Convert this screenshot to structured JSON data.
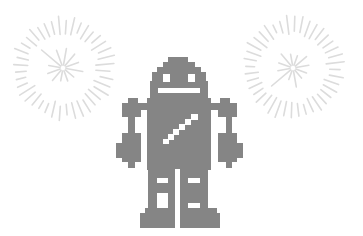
{
  "scene": {
    "title": "Pixel robot with fireworks",
    "width": 363,
    "height": 236,
    "background": "#ffffff"
  },
  "colors": {
    "robot": "#858585",
    "robot_detail": "#ffffff",
    "firework": "#dcdcdc"
  },
  "fireworks": [
    {
      "name": "firework-left",
      "cx": 63,
      "cy": 68,
      "outer": {
        "count": 40,
        "r1": 36,
        "r2": 50,
        "jitter": 3,
        "offset": 4
      },
      "inner": {
        "count": 12,
        "r1": 3,
        "r2": 20,
        "long_index": 7,
        "long_r2": 28,
        "offset": 10
      }
    },
    {
      "name": "firework-right",
      "cx": 293,
      "cy": 68,
      "outer": {
        "count": 40,
        "r1": 36,
        "r2": 50,
        "jitter": 3,
        "offset": 2
      },
      "inner": {
        "count": 12,
        "r1": 3,
        "r2": 20,
        "long_index": 4,
        "long_r2": 28,
        "offset": 20
      }
    }
  ],
  "robot": {
    "body_parts": [
      {
        "part": "head-top",
        "x": 168,
        "y": 57,
        "w": 20,
        "h": 5
      },
      {
        "part": "head-row2",
        "x": 163,
        "y": 62,
        "w": 32,
        "h": 6
      },
      {
        "part": "head-row3",
        "x": 157,
        "y": 67,
        "w": 44,
        "h": 6
      },
      {
        "part": "head-main",
        "x": 152,
        "y": 72,
        "w": 54,
        "h": 10
      },
      {
        "part": "head-lower",
        "x": 150,
        "y": 81,
        "w": 58,
        "h": 18
      },
      {
        "part": "torso",
        "x": 147,
        "y": 98,
        "w": 64,
        "h": 72
      },
      {
        "part": "left-leg",
        "x": 148,
        "y": 169,
        "w": 27,
        "h": 40
      },
      {
        "part": "right-leg",
        "x": 180,
        "y": 169,
        "w": 28,
        "h": 40
      },
      {
        "part": "left-foot-step",
        "x": 145,
        "y": 208,
        "w": 30,
        "h": 6
      },
      {
        "part": "left-foot",
        "x": 140,
        "y": 213,
        "w": 35,
        "h": 15
      },
      {
        "part": "right-foot-step",
        "x": 180,
        "y": 208,
        "w": 37,
        "h": 6
      },
      {
        "part": "right-foot",
        "x": 180,
        "y": 213,
        "w": 40,
        "h": 15
      },
      {
        "part": "left-shoulder",
        "x": 140,
        "y": 103,
        "w": 8,
        "h": 7
      },
      {
        "part": "left-arm-cap",
        "x": 128,
        "y": 98,
        "w": 10,
        "h": 6
      },
      {
        "part": "left-arm-top",
        "x": 122,
        "y": 103,
        "w": 19,
        "h": 14
      },
      {
        "part": "left-arm-shaft",
        "x": 128,
        "y": 116,
        "w": 7,
        "h": 18
      },
      {
        "part": "left-hand",
        "x": 122,
        "y": 133,
        "w": 19,
        "h": 29
      },
      {
        "part": "left-hand-bulge",
        "x": 116,
        "y": 143,
        "w": 7,
        "h": 15
      },
      {
        "part": "left-finger",
        "x": 128,
        "y": 161,
        "w": 7,
        "h": 7
      },
      {
        "part": "right-shoulder",
        "x": 210,
        "y": 103,
        "w": 9,
        "h": 7
      },
      {
        "part": "right-arm-cap",
        "x": 220,
        "y": 98,
        "w": 10,
        "h": 6
      },
      {
        "part": "right-arm-top",
        "x": 218,
        "y": 103,
        "w": 19,
        "h": 14
      },
      {
        "part": "right-arm-shaft",
        "x": 226,
        "y": 116,
        "w": 6,
        "h": 18
      },
      {
        "part": "right-hand",
        "x": 218,
        "y": 133,
        "w": 19,
        "h": 29
      },
      {
        "part": "right-hand-bulge",
        "x": 236,
        "y": 143,
        "w": 7,
        "h": 15
      },
      {
        "part": "right-finger",
        "x": 226,
        "y": 161,
        "w": 6,
        "h": 7
      }
    ],
    "details": [
      {
        "part": "left-eye",
        "x": 163,
        "y": 74,
        "w": 7,
        "h": 8
      },
      {
        "part": "right-eye",
        "x": 188,
        "y": 74,
        "w": 7,
        "h": 8
      },
      {
        "part": "mouth",
        "x": 158,
        "y": 88,
        "w": 42,
        "h": 5
      },
      {
        "part": "leg-gap",
        "x": 175,
        "y": 169,
        "w": 5,
        "h": 59
      },
      {
        "part": "left-leg-band",
        "x": 157,
        "y": 178,
        "w": 11,
        "h": 5
      },
      {
        "part": "left-leg-window",
        "x": 157,
        "y": 193,
        "w": 11,
        "h": 15
      },
      {
        "part": "right-leg-band",
        "x": 188,
        "y": 178,
        "w": 12,
        "h": 5
      },
      {
        "part": "right-leg-band-2",
        "x": 188,
        "y": 203,
        "w": 12,
        "h": 5
      },
      {
        "part": "chest-stripe-1",
        "x": 163,
        "y": 139,
        "w": 6,
        "h": 5
      },
      {
        "part": "chest-stripe-2",
        "x": 168,
        "y": 134,
        "w": 6,
        "h": 6
      },
      {
        "part": "chest-stripe-3",
        "x": 173,
        "y": 129,
        "w": 6,
        "h": 6
      },
      {
        "part": "chest-stripe-4",
        "x": 179,
        "y": 124,
        "w": 6,
        "h": 6
      },
      {
        "part": "chest-stripe-5",
        "x": 185,
        "y": 119,
        "w": 6,
        "h": 6
      },
      {
        "part": "chest-stripe-6",
        "x": 191,
        "y": 114,
        "w": 7,
        "h": 6
      }
    ]
  }
}
